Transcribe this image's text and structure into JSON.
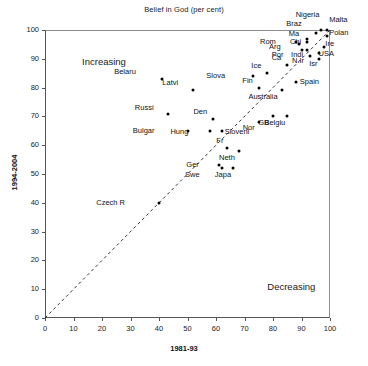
{
  "chart_data": {
    "type": "scatter",
    "title": "Belief in God (per cent)",
    "xlabel": "1981-93",
    "ylabel": "1994-2004",
    "xlim": [
      0,
      100
    ],
    "ylim": [
      0,
      100
    ],
    "xticks": [
      0,
      10,
      20,
      30,
      40,
      50,
      60,
      70,
      80,
      90,
      100
    ],
    "yticks": [
      0,
      10,
      20,
      30,
      40,
      50,
      60,
      70,
      80,
      90,
      100
    ],
    "grid": false,
    "legend": "none",
    "reference_line": {
      "type": "diagonal-identity",
      "style": "dashed",
      "from": [
        0,
        0
      ],
      "to": [
        100,
        100
      ]
    },
    "annotations": [
      {
        "text": "Increasing",
        "x": 13,
        "y": 91
      },
      {
        "text": "Decreasing",
        "x": 78,
        "y": 13
      }
    ],
    "points": [
      {
        "label": "Belaru",
        "x": 41,
        "y": 83,
        "lx": -26,
        "ly": -11
      },
      {
        "label": "Latvi",
        "x": 52,
        "y": 79,
        "lx": -15,
        "ly": -11
      },
      {
        "label": "Russi",
        "x": 43,
        "y": 71,
        "lx": -14,
        "ly": -10
      },
      {
        "label": "Bulgar",
        "x": 50,
        "y": 65,
        "lx": -33,
        "ly": -4
      },
      {
        "label": "Slova",
        "x": 73,
        "y": 84,
        "lx": -28,
        "ly": -4
      },
      {
        "label": "Ice",
        "x": 78,
        "y": 85,
        "lx": -6,
        "ly": -11
      },
      {
        "label": "Fin",
        "x": 75,
        "y": 80,
        "lx": -6,
        "ly": -11
      },
      {
        "label": "Ca",
        "x": 85,
        "y": 88,
        "lx": -6,
        "ly": -11
      },
      {
        "label": "Spain",
        "x": 88,
        "y": 82,
        "lx": 4,
        "ly": -4
      },
      {
        "label": "Australia",
        "x": 83,
        "y": 79,
        "lx": -4,
        "ly": 3
      },
      {
        "label": "Den",
        "x": 59,
        "y": 69,
        "lx": -6,
        "ly": -11
      },
      {
        "label": "Hung",
        "x": 58,
        "y": 65,
        "lx": -22,
        "ly": -3
      },
      {
        "label": "Sloveni",
        "x": 62,
        "y": 65,
        "lx": 3,
        "ly": -3
      },
      {
        "label": "Nor",
        "x": 75,
        "y": 68,
        "lx": -4,
        "ly": 2
      },
      {
        "label": "GB",
        "x": 80,
        "y": 70,
        "lx": -4,
        "ly": 3
      },
      {
        "label": "Belgiu",
        "x": 85,
        "y": 70,
        "lx": -2,
        "ly": 3
      },
      {
        "label": "Fr",
        "x": 64,
        "y": 59,
        "lx": -4,
        "ly": -11
      },
      {
        "label": "Neth",
        "x": 68,
        "y": 58,
        "lx": -4,
        "ly": 3
      },
      {
        "label": "Ger",
        "x": 61,
        "y": 53,
        "lx": -20,
        "ly": -4
      },
      {
        "label": "Swe",
        "x": 62,
        "y": 52,
        "lx": -22,
        "ly": 3
      },
      {
        "label": "Japa",
        "x": 66,
        "y": 52,
        "lx": -2,
        "ly": 3
      },
      {
        "label": "Czech R",
        "x": 40,
        "y": 40,
        "lx": -34,
        "ly": -4
      },
      {
        "label": "Rom",
        "x": 88,
        "y": 96,
        "lx": -20,
        "ly": -4
      },
      {
        "label": "Arg",
        "x": 89,
        "y": 95,
        "lx": -18,
        "ly": -1
      },
      {
        "label": "Por",
        "x": 90,
        "y": 93,
        "lx": -18,
        "ly": 1
      },
      {
        "label": "Indi",
        "x": 92,
        "y": 93,
        "lx": -4,
        "ly": 1
      },
      {
        "label": "Chi",
        "x": 92,
        "y": 96,
        "lx": -6,
        "ly": -4
      },
      {
        "label": "Ma",
        "x": 92,
        "y": 97,
        "lx": -8,
        "ly": -9
      },
      {
        "label": "Braz",
        "x": 95,
        "y": 99,
        "lx": -14,
        "ly": -13
      },
      {
        "label": "Nigeria",
        "x": 97,
        "y": 100,
        "lx": -2,
        "ly": -19
      },
      {
        "label": "Malta",
        "x": 99,
        "y": 100,
        "lx": 2,
        "ly": -14
      },
      {
        "label": "Polan",
        "x": 99,
        "y": 98,
        "lx": 2,
        "ly": -7
      },
      {
        "label": "N.Ir",
        "x": 93,
        "y": 91,
        "lx": -6,
        "ly": 1
      },
      {
        "label": "USA",
        "x": 96,
        "y": 92,
        "lx": 0,
        "ly": -3
      },
      {
        "label": "Ire",
        "x": 98,
        "y": 94,
        "lx": 1,
        "ly": -7
      },
      {
        "label": "Isr",
        "x": 96,
        "y": 90,
        "lx": -1,
        "ly": 1
      }
    ]
  }
}
